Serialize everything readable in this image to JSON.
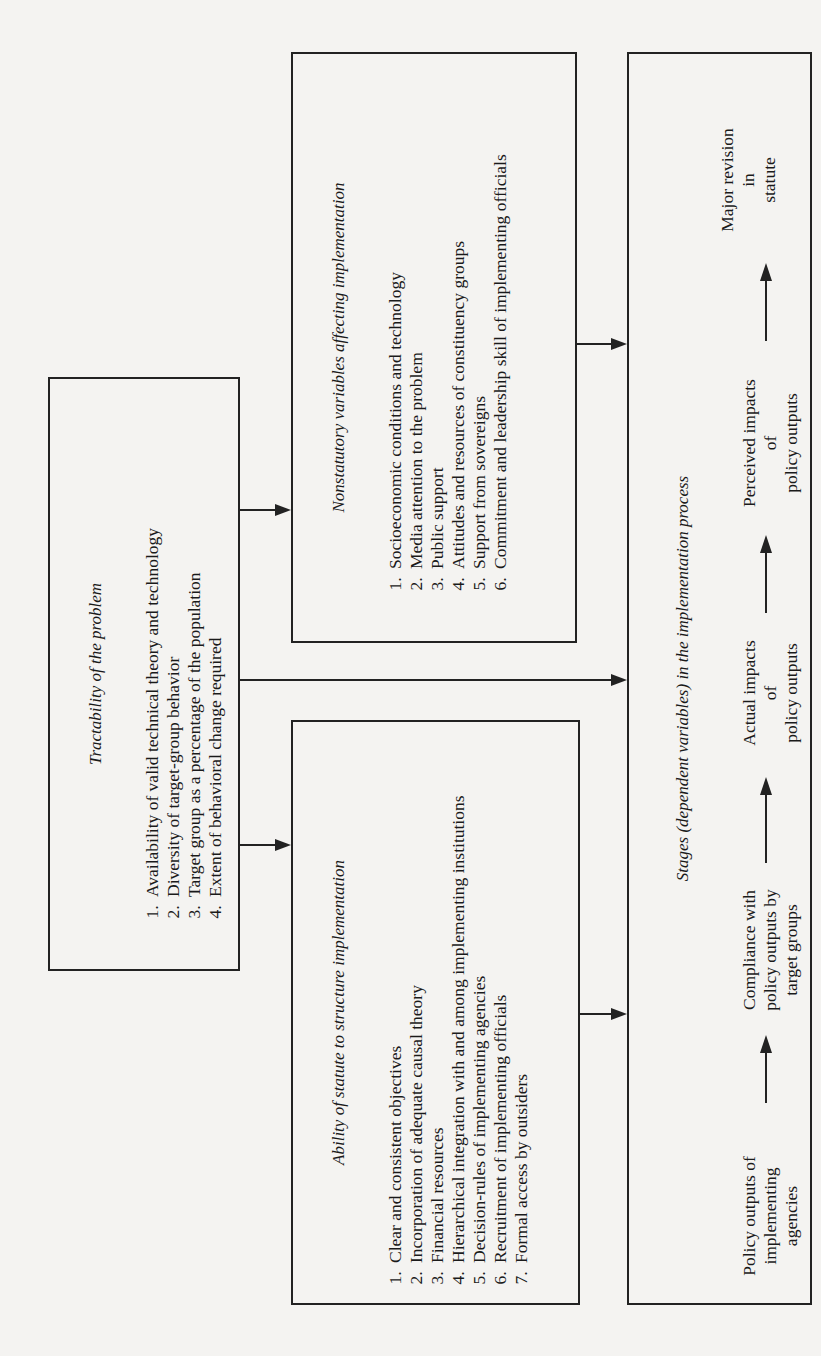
{
  "diagram": {
    "orientation": "rotated-90-counterclockwise",
    "tractability": {
      "title": "Tractability of the problem",
      "items": [
        "Availability of valid technical theory and technology",
        "Diversity of target-group behavior",
        "Target group as a percentage of the population",
        "Extent of behavioral change required"
      ]
    },
    "statute": {
      "title": "Ability of statute to structure implementation",
      "items": [
        "Clear and consistent objectives",
        "Incorporation of adequate causal theory",
        "Financial resources",
        "Hierarchical integration with and among implementing institutions",
        "Decision-rules of implementing agencies",
        "Recruitment of implementing officials",
        "Formal access by outsiders"
      ]
    },
    "nonstatutory": {
      "title": "Nonstatutory variables affecting implementation",
      "items": [
        "Socioeconomic conditions and technology",
        "Media attention to the problem",
        "Public support",
        "Attitudes and resources of constituency groups",
        "Support from sovereigns",
        "Commitment and leadership skill of implementing officials"
      ]
    },
    "stages": {
      "title": "Stages (dependent variables) in the implementation process",
      "steps": [
        {
          "line1": "Policy outputs of",
          "line2": "implementing",
          "line3": "agencies"
        },
        {
          "line1": "Compliance with",
          "line2": "policy outputs by",
          "line3": "target groups"
        },
        {
          "line1": "Actual impacts",
          "line2": "of",
          "line3": "policy outputs"
        },
        {
          "line1": "Perceived impacts",
          "line2": "of",
          "line3": "policy outputs"
        },
        {
          "line1": "Major revision",
          "line2": "in",
          "line3": "statute"
        }
      ]
    },
    "connections": [
      {
        "from": "tractability",
        "to": "statute"
      },
      {
        "from": "tractability",
        "to": "nonstatutory"
      },
      {
        "from": "tractability",
        "to": "stages"
      },
      {
        "from": "statute",
        "to": "stages"
      },
      {
        "from": "nonstatutory",
        "to": "stages"
      }
    ]
  }
}
